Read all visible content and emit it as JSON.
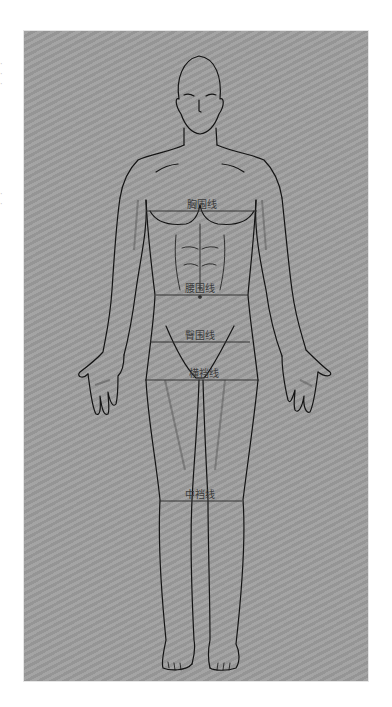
{
  "diagram": {
    "background_color": "#9d9d9d",
    "line_color": "#141414",
    "measure_line_color": "#333333",
    "measurement_lines": [
      {
        "label": "胸围线",
        "y": 211,
        "x1": 146,
        "x2": 257,
        "label_x": 202,
        "label_y": 196
      },
      {
        "label": "腰围线",
        "y": 295,
        "x1": 156,
        "x2": 248,
        "label_x": 200,
        "label_y": 280
      },
      {
        "label": "臀围线",
        "y": 342,
        "x1": 150,
        "x2": 250,
        "label_x": 200,
        "label_y": 327
      },
      {
        "label": "横裆线",
        "y": 380,
        "x1": 145,
        "x2": 258,
        "label_x": 204,
        "label_y": 365
      },
      {
        "label": "中裆线",
        "y": 501,
        "x1": 160,
        "x2": 242,
        "label_x": 200,
        "label_y": 486
      }
    ]
  }
}
